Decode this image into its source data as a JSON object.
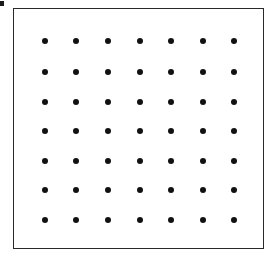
{
  "diagram": {
    "type": "dot-grid",
    "rows": 7,
    "cols": 7,
    "dot_color": "#111111",
    "frame_color": "#2a2a2a",
    "background": "#ffffff",
    "x_positions": [
      45,
      76,
      108,
      140,
      171,
      203,
      234
    ],
    "y_positions": [
      41,
      72,
      102,
      131,
      161,
      190,
      220
    ],
    "dot_diameter": 6
  }
}
